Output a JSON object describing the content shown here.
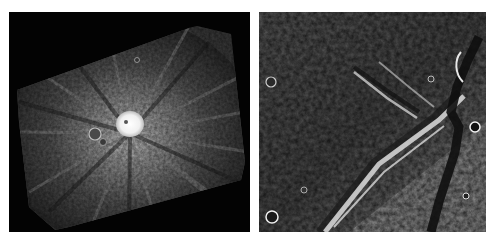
{
  "figure": {
    "panels": [
      {
        "id": "left",
        "subject": "bright-rayed-impact-crater",
        "description": "Rotated image footprint on black background showing a bright central crater with radial ray streaks",
        "colors": {
          "background": "#030303",
          "terrain": "#5a5a5a",
          "crater_core": "#f4f4f4"
        }
      },
      {
        "id": "right",
        "subject": "lobate-scarp-and-trough-terrain",
        "description": "Rough cratered terrain crossed by a diagonal bright scarp and a dark sinuous trough on the right",
        "colors": {
          "base": "#6e6e6e",
          "shadow": "#1a1a1a",
          "highlight": "#d8d8d8"
        }
      }
    ]
  }
}
